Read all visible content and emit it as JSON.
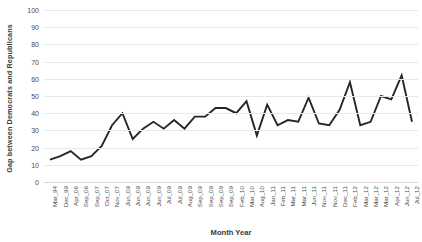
{
  "chart_data": {
    "type": "line",
    "title": "",
    "xlabel": "Month Year",
    "ylabel": "Gap between Democrats and Republicans",
    "ylim": [
      0,
      100
    ],
    "ytick_step": 10,
    "yticks": [
      0,
      10,
      20,
      30,
      40,
      50,
      60,
      70,
      80,
      90,
      100
    ],
    "grid": true,
    "legend": "none",
    "line_color": "#262626",
    "categories": [
      "Mar_94",
      "Dec_99",
      "Apr_06",
      "Sep_06",
      "Sep_07",
      "Oct_07",
      "Nov_07",
      "Jun_09",
      "Jun_09",
      "Jun_09",
      "Jun_09",
      "Jul_09",
      "Jul_09",
      "Aug_09",
      "Sep_09",
      "Sep_09",
      "Sep_09",
      "Sep_09",
      "Feb_10",
      "Mar_10",
      "Aug_10",
      "Jan_11",
      "Feb_11",
      "Mar_11",
      "Mar_11",
      "Jun_11",
      "Nov_11",
      "Nov_11",
      "Dec_11",
      "Feb_12",
      "Mar_12",
      "Mar_12",
      "Mar_12",
      "Apr_12",
      "Jun_12",
      "Jul_12"
    ],
    "values": [
      13,
      15,
      18,
      13,
      15,
      21,
      33,
      40,
      25,
      31,
      35,
      31,
      36,
      31,
      38,
      38,
      43,
      43,
      40,
      47,
      27,
      45,
      33,
      36,
      35,
      49,
      34,
      33,
      42,
      58,
      33,
      35,
      50,
      48,
      62,
      35
    ],
    "series_name": "Gap between Democrats and Republicans"
  }
}
